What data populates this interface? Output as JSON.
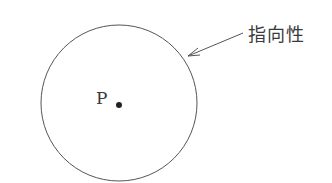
{
  "diagram": {
    "annotation_label": "指向性",
    "point_label": "P",
    "colors": {
      "stroke": "#555555",
      "text": "#3a3a3a",
      "background": "#ffffff"
    }
  }
}
